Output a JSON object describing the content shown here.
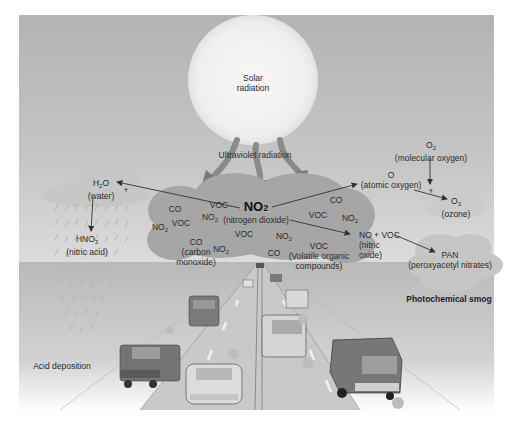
{
  "diagram": {
    "title_center": "NO2",
    "sun": {
      "line1": "Solar",
      "line2": "radiation"
    },
    "uv_label": "Ultraviolet radiation",
    "center": {
      "formula": "NO",
      "formula_sub": "2",
      "name": "(nitrogen dioxide)"
    },
    "water": {
      "formula": "H",
      "formula_sub": "2",
      "formula_tail": "O",
      "name": "(water)",
      "plus": "+"
    },
    "nitric_acid": {
      "formula": "HNO",
      "formula_sub": "3",
      "name": "(nitric acid)"
    },
    "atomic_oxygen": {
      "formula": "O",
      "name": "(atomic oxygen)"
    },
    "molecular_oxygen": {
      "formula": "O",
      "formula_sub": "2",
      "name": "(molecular oxygen)",
      "plus": "+"
    },
    "ozone": {
      "formula": "O",
      "formula_sub": "3",
      "name": "(ozone)"
    },
    "no_voc": {
      "line1": "NO + VOC",
      "line2": "(nitric",
      "line3": "oxide)"
    },
    "pan": {
      "formula": "PAN",
      "name": "(peroxyacetyl nitrates)"
    },
    "cloud_labels": {
      "voc_top": "VOC",
      "co_left": "CO",
      "voc_left": "VOC",
      "no2_a": "NO",
      "no2_left": "NO",
      "co_carbon": "CO",
      "carbon_line1": "(carbon",
      "carbon_line2": "monoxide)",
      "no2_b": "NO",
      "voc_mid": "VOC",
      "no2_mid": "NO",
      "co_bottom": "CO",
      "voc_right": "VOC",
      "co_right": "CO",
      "no2_right": "NO",
      "voc_bottom": "VOC",
      "voc_name1": "(Volatile organic",
      "voc_name2": "compounds)",
      "sub2": "2"
    },
    "section_labels": {
      "photochemical_smog": "Photochemical smog",
      "acid_deposition": "Acid deposition"
    }
  },
  "colors": {
    "sky": "#b9b9b9",
    "ground": "#c4c4c4",
    "sun": "#f2f2f2",
    "cloud": "#a9a9a9",
    "arrow": "#7d7d7d",
    "car_dark": "#6e6e6e",
    "car_light": "#dcdcdc"
  }
}
